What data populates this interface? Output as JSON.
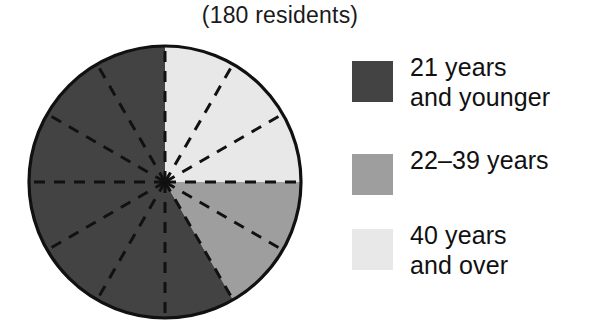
{
  "chart_data": {
    "type": "pie",
    "title": "(180 residents)",
    "total": 180,
    "units": "residents",
    "segments": 12,
    "segment_degrees": 30,
    "start_angle_deg": 0,
    "direction": "clockwise",
    "categories": [
      "40 years and over",
      "22-39 years",
      "21 years and younger"
    ],
    "values": [
      45,
      30,
      105
    ],
    "wedge_counts": [
      3,
      2,
      7
    ],
    "fractions": [
      0.25,
      0.16667,
      0.58333
    ],
    "colors": [
      "#e8e8e8",
      "#9e9e9e",
      "#434343"
    ],
    "slices": [
      {
        "label": "40 years and over",
        "wedges": 3,
        "value": 45,
        "start_deg": 0,
        "end_deg": 90,
        "color": "#e8e8e8"
      },
      {
        "label": "22-39 years",
        "wedges": 2,
        "value": 30,
        "start_deg": 90,
        "end_deg": 150,
        "color": "#9e9e9e"
      },
      {
        "label": "21 years and younger",
        "wedges": 7,
        "value": 105,
        "start_deg": 150,
        "end_deg": 360,
        "color": "#434343"
      }
    ],
    "xlabel": "",
    "ylabel": "",
    "grid": false,
    "legend_position": "right",
    "divider_style": "dashed",
    "divider_color": "#111111",
    "outline_color": "#111111"
  },
  "legend": {
    "items": [
      {
        "label": "21 years\nand younger",
        "color": "#434343",
        "swatch_name": "swatch-21-and-younger"
      },
      {
        "label": "22–39 years",
        "color": "#9e9e9e",
        "swatch_name": "swatch-22-39"
      },
      {
        "label": "40 years\nand over",
        "color": "#e8e8e8",
        "swatch_name": "swatch-40-and-over"
      }
    ]
  }
}
